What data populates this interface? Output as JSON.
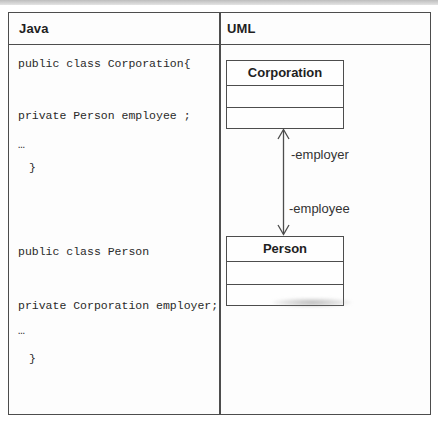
{
  "figure": {
    "type": "java-vs-uml comparison table",
    "colors": {
      "table_border": "#4d4d4d",
      "header_text": "#1f1f1f",
      "code_text": "#2a2a2a",
      "label_text": "#333333",
      "scan_band": "#bdbdbd",
      "background": "#ffffff"
    }
  },
  "table": {
    "header": {
      "left": "Java",
      "right": "UML"
    }
  },
  "java": {
    "lines": [
      {
        "text": "public class Corporation{"
      },
      {
        "text": "private Person employee ;"
      },
      {
        "text": "…"
      },
      {
        "text": "}"
      },
      {
        "text": "public class Person"
      },
      {
        "text": "private Corporation employer;"
      },
      {
        "text": "…"
      },
      {
        "text": "}"
      }
    ]
  },
  "uml": {
    "classes": [
      {
        "name": "Corporation"
      },
      {
        "name": "Person"
      }
    ],
    "association": {
      "top_label": "-employer",
      "bottom_label": "-employee",
      "arrow_style": "open arrowheads both ends"
    }
  }
}
